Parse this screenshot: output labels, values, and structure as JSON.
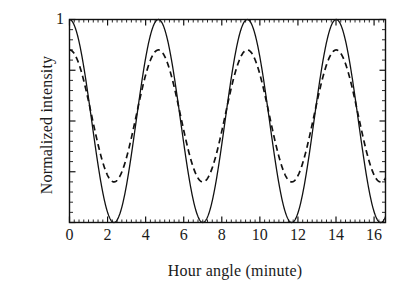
{
  "figure": {
    "background": "#ffffff",
    "ink": "#111111"
  },
  "chart_data": {
    "type": "line",
    "title": "",
    "xlabel": "Hour angle (minute)",
    "ylabel": "Normalized intensity",
    "xlim": [
      0,
      16.6
    ],
    "ylim": [
      0,
      1
    ],
    "grid": false,
    "legend": "none",
    "xticks": [
      0,
      2,
      4,
      6,
      8,
      10,
      12,
      14,
      16
    ],
    "xtick_labels": [
      "0",
      "2",
      "4",
      "6",
      "8",
      "10",
      "12",
      "14",
      "16"
    ],
    "yticks": [
      1
    ],
    "ytick_labels": [
      "1"
    ],
    "x_minor_tick_step": 0.25,
    "y_minor_tick_count": 20,
    "period_minutes": 4.67,
    "peak_positions": [
      0.0,
      4.7,
      9.37,
      14.04
    ],
    "trough_positions": [
      2.35,
      7.03,
      11.7,
      16.37
    ],
    "series": [
      {
        "name": "solid",
        "style": "solid",
        "color": "#111111",
        "linewidth": 1.3,
        "form": "cosine-squared",
        "amplitude_max": 1.0,
        "amplitude_min": 0.0,
        "phase_minutes": 0.0
      },
      {
        "name": "dashed",
        "style": "dashed",
        "color": "#111111",
        "linewidth": 1.6,
        "dash_pattern": "6,4",
        "form": "cosine-squared",
        "amplitude_max": 0.85,
        "amplitude_min": 0.2,
        "phase_minutes": 0.0
      }
    ],
    "sampled_points": {
      "x": [
        0,
        0.5,
        1,
        1.5,
        2,
        2.35,
        3,
        3.5,
        4,
        4.7,
        5.5,
        6,
        6.5,
        7.03,
        7.5,
        8,
        9,
        9.37,
        10,
        11,
        11.7,
        12.5,
        13,
        14.04,
        15,
        16,
        16.37
      ],
      "solid": [
        1.0,
        0.89,
        0.6,
        0.26,
        0.04,
        0.0,
        0.15,
        0.45,
        0.77,
        1.0,
        0.77,
        0.53,
        0.22,
        0.0,
        0.1,
        0.33,
        0.89,
        1.0,
        0.83,
        0.25,
        0.0,
        0.2,
        0.51,
        1.0,
        0.6,
        0.03,
        0.0
      ],
      "dashed": [
        0.85,
        0.78,
        0.6,
        0.38,
        0.24,
        0.2,
        0.29,
        0.46,
        0.67,
        0.85,
        0.67,
        0.54,
        0.35,
        0.2,
        0.26,
        0.41,
        0.78,
        0.85,
        0.73,
        0.36,
        0.2,
        0.33,
        0.53,
        0.85,
        0.6,
        0.22,
        0.2
      ]
    }
  }
}
